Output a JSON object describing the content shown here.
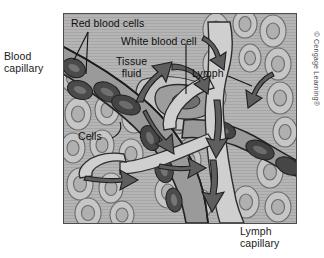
{
  "figure": {
    "frame_color": "#4d4d4d",
    "background_color": "#b9b9b9"
  },
  "labels": {
    "blood_capillary": "Blood\ncapillary",
    "red_blood_cells": "Red blood cells",
    "white_blood_cell": "White blood cell",
    "tissue_fluid": "Tissue\nfluid",
    "lymph": "Lymph",
    "cells": "Cells",
    "lymph_capillary": "Lymph\ncapillary"
  },
  "credit": {
    "text": "© Cengage Learning®"
  },
  "palette": {
    "tissue_background": "#b5b5b5",
    "tissue_cell_fill": "#c6c6c6",
    "tissue_cell_stroke": "#6b6b6b",
    "nucleus_fill": "#b0b0b0",
    "capillary_lumen": "#9a9a9a",
    "lymph_lumen": "#cfcfcf",
    "red_blood_cell": "#4a4a4a",
    "red_blood_cell_highlight": "#6e6e6e",
    "white_blood_cell": "#9d9d9d",
    "white_blood_cell_nucleus": "#6f6f6f",
    "arrow_fill": "#5e5e5e",
    "outline": "#2b2b2b",
    "label_text": "#0f0f0f"
  },
  "structures": [
    {
      "name": "blood-capillary",
      "description": "Diagonal vessel from upper-left carrying red blood cells"
    },
    {
      "name": "red-blood-cells",
      "description": "Dark biconcave discs inside the blood capillary"
    },
    {
      "name": "white-blood-cell",
      "description": "Amoeboid cell with nucleus in tissue fluid space"
    },
    {
      "name": "tissue-fluid",
      "description": "Pale fluid space surrounding the cells"
    },
    {
      "name": "lymph-capillary",
      "description": "Blind-ended pale vessel on the right draining downward"
    },
    {
      "name": "tissue-cells",
      "description": "Field of rounded nucleated cells filling the tissue"
    },
    {
      "name": "flow-arrows",
      "description": "Dark arrows showing fluid moving from tissue into lymph capillary"
    }
  ]
}
